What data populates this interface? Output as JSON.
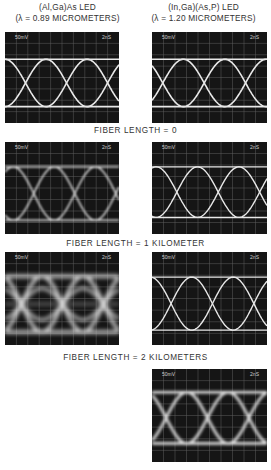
{
  "columns": [
    {
      "line1": "(Al,Ga)As  LED",
      "line2": "(λ = 0.89 MICROMETERS)"
    },
    {
      "line1": "(In,Ga)(As,P)  LED",
      "line2": "(λ = 1.20 MICROMETERS)"
    }
  ],
  "fiber_labels": [
    "FIBER LENGTH = 0",
    "FIBER LENGTH = 1 KILOMETER",
    "FIBER LENGTH = 2 KILOMETERS"
  ],
  "scope_labels": {
    "volts_per_div": "50mV",
    "time_per_div": "2nS"
  },
  "panels": [
    {
      "id": "al-0km",
      "led": "(Al,Ga)As",
      "fiber": "0",
      "blur": 0.6
    },
    {
      "id": "in-0km",
      "led": "(In,Ga)(As,P)",
      "fiber": "0",
      "blur": 0.6
    },
    {
      "id": "al-1km",
      "led": "(Al,Ga)As",
      "fiber": "1 km",
      "blur": 0.9
    },
    {
      "id": "in-1km",
      "led": "(In,Ga)(As,P)",
      "fiber": "1 km",
      "blur": 0.7
    },
    {
      "id": "al-2km",
      "led": "(Al,Ga)As",
      "fiber": "2 km",
      "blur": 2.2
    },
    {
      "id": "in-2km",
      "led": "(In,Ga)(As,P)",
      "fiber": "2 km",
      "blur": 1.2
    }
  ],
  "colors": {
    "screen": "#151515",
    "trace": "#e8e8e8",
    "grid": "#9a9a9a"
  }
}
